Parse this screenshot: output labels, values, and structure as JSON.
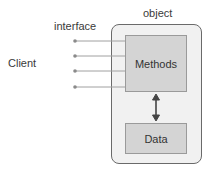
{
  "diagram": {
    "client_label": "Client",
    "interface_label": "interface",
    "object_label": "object",
    "methods_label": "Methods",
    "data_label": "Data",
    "interface_count": 4,
    "colors": {
      "object_fill": "#f1f1f1",
      "inner_fill": "#d4d4d4",
      "line": "#9a9a9a",
      "arrow": "#444444"
    }
  }
}
